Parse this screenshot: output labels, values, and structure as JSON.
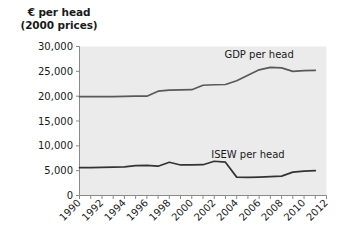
{
  "chart_data": {
    "type": "line",
    "title": "",
    "ylabel_line1": "€ per head",
    "ylabel_line2": "(2000 prices)",
    "xlabel": "",
    "x": [
      1990,
      1991,
      1992,
      1993,
      1994,
      1995,
      1996,
      1997,
      1998,
      1999,
      2000,
      2001,
      2002,
      2003,
      2004,
      2005,
      2006,
      2007,
      2008,
      2009,
      2010,
      2011
    ],
    "xlim": [
      1990,
      2012
    ],
    "ylim": [
      0,
      30000
    ],
    "yticks": [
      0,
      5000,
      10000,
      15000,
      20000,
      25000,
      30000
    ],
    "ytick_labels": [
      "0",
      "5,000",
      "10,000",
      "15,000",
      "20,000",
      "25,000",
      "30,000"
    ],
    "xticks": [
      1990,
      1991,
      1992,
      1993,
      1994,
      1995,
      1996,
      1997,
      1998,
      1999,
      2000,
      2001,
      2002,
      2003,
      2004,
      2005,
      2006,
      2007,
      2008,
      2009,
      2010,
      2011,
      2012
    ],
    "xtick_labels": [
      "1990",
      "1992",
      "1994",
      "1996",
      "1998",
      "2000",
      "2002",
      "2004",
      "2006",
      "2008",
      "2010",
      "2012"
    ],
    "xtick_labels_years": [
      1990,
      1992,
      1994,
      1996,
      1998,
      2000,
      2002,
      2004,
      2006,
      2008,
      2010,
      2012
    ],
    "grid": false,
    "legend_position": "inline-annotation",
    "plot_background": "#ebebeb",
    "series": [
      {
        "name": "GDP per head",
        "color": "#595959",
        "label_x": 2006,
        "label_y": 27600,
        "values": [
          19900,
          19900,
          19900,
          19900,
          19950,
          20000,
          20000,
          21000,
          21200,
          21250,
          21300,
          22200,
          22300,
          22350,
          23100,
          24200,
          25300,
          25800,
          25700,
          25000,
          25150,
          25200
        ]
      },
      {
        "name": "ISEW per head",
        "color": "#333333",
        "label_x": 2005,
        "label_y": 7600,
        "values": [
          5600,
          5600,
          5650,
          5700,
          5750,
          6000,
          6050,
          5900,
          6700,
          6150,
          6150,
          6200,
          6900,
          6700,
          3700,
          3650,
          3700,
          3800,
          3900,
          4700,
          4900,
          5000
        ]
      }
    ]
  }
}
